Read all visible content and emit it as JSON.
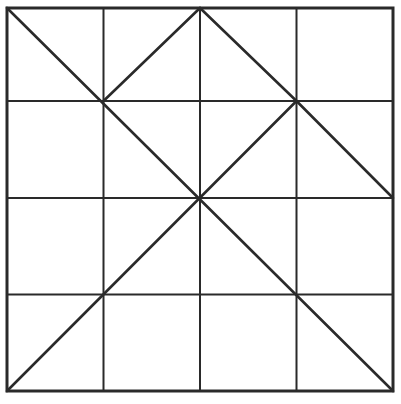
{
  "diagram": {
    "type": "grid-with-diagonals",
    "rows": 4,
    "cols": 4,
    "stroke_color": "#2a2a2a",
    "background": "#ffffff",
    "grid_x": [
      7,
      103.5,
      200,
      296.5,
      393
    ],
    "grid_y": [
      8,
      101,
      198,
      294.5,
      391
    ],
    "diagonals": [
      {
        "name": "main-diagonal",
        "from": [
          0,
          0
        ],
        "to": [
          4,
          4
        ]
      },
      {
        "name": "diagonal-1-1-to-2-0",
        "from": [
          1,
          1
        ],
        "to": [
          2,
          0
        ]
      },
      {
        "name": "diagonal-2-0-to-3-1",
        "from": [
          2,
          0
        ],
        "to": [
          3,
          1
        ]
      },
      {
        "name": "diagonal-3-1-to-4-2",
        "from": [
          3,
          1
        ],
        "to": [
          4,
          2
        ]
      },
      {
        "name": "anti-diagonal-3-1-to-0-4",
        "from": [
          3,
          1
        ],
        "to": [
          0,
          4
        ]
      }
    ]
  }
}
